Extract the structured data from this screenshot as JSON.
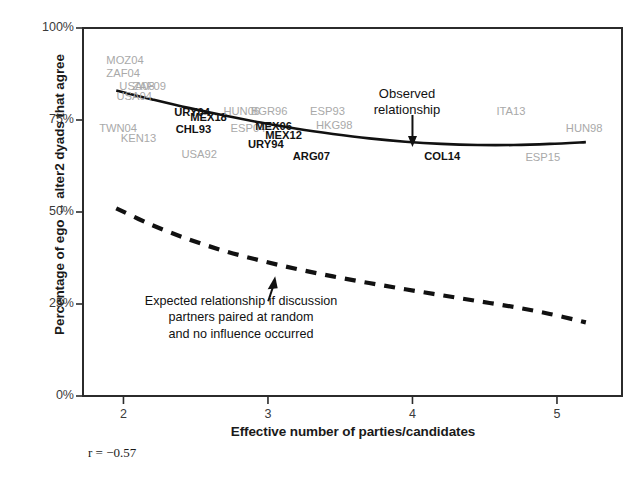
{
  "chart_data": {
    "type": "line",
    "title": "",
    "xlabel": "Effective number of parties/candidates",
    "ylabel": "Percentage of ego ↔ alter2 dyads that agree",
    "xlim": [
      1.72,
      5.45
    ],
    "ylim": [
      0,
      100
    ],
    "xticks": [
      "2",
      "3",
      "4",
      "5"
    ],
    "xtick_values": [
      2,
      3,
      4,
      5
    ],
    "yticks": [
      "0%",
      "25%",
      "50%",
      "75%",
      "100%"
    ],
    "ytick_values": [
      0,
      25,
      50,
      75,
      100
    ],
    "grid": false,
    "legend": "none",
    "correlation_label": "r = −0.57",
    "correlation_value": -0.57,
    "series": [
      {
        "name": "Observed relationship",
        "style": "solid",
        "color": "#111111",
        "x": [
          1.95,
          2.2,
          2.45,
          2.7,
          2.95,
          3.2,
          3.45,
          3.7,
          3.95,
          4.2,
          4.45,
          4.7,
          4.95,
          5.2
        ],
        "values": [
          83.0,
          80.6,
          78.3,
          76.2,
          74.3,
          72.6,
          71.2,
          70.0,
          69.1,
          68.5,
          68.2,
          68.2,
          68.5,
          69.0
        ]
      },
      {
        "name": "Expected relationship if discussion partners paired at random and no influence occurred",
        "style": "dashed",
        "color": "#111111",
        "x": [
          1.95,
          2.2,
          2.45,
          2.7,
          2.95,
          3.2,
          3.45,
          3.7,
          3.95,
          4.2,
          4.45,
          4.7,
          4.95,
          5.2
        ],
        "values": [
          51.0,
          46.4,
          42.6,
          39.4,
          36.8,
          34.5,
          32.5,
          30.7,
          29.0,
          27.4,
          25.8,
          24.2,
          22.3,
          20.0
        ]
      }
    ],
    "annotations": [
      {
        "name": "observed-relationship-annotation",
        "lines": [
          "Observed",
          "relationship"
        ],
        "text": "Observed relationship",
        "arrow": "down",
        "x": 4.0,
        "y": 71.0
      },
      {
        "name": "expected-relationship-annotation",
        "lines": [
          "Expected relationship if discussion",
          "partners paired at random",
          "and no influence occurred"
        ],
        "text": "Expected relationship if discussion partners paired at random and no influence occurred",
        "arrow": "up",
        "x": 3.05,
        "y": 32.0
      }
    ],
    "point_labels": [
      {
        "label": "MOZ04",
        "x": 2.02,
        "y": 91.0,
        "emphasis": "dim"
      },
      {
        "label": "ZAF04",
        "x": 2.02,
        "y": 87.4,
        "emphasis": "dim"
      },
      {
        "label": "USA08",
        "x": 2.11,
        "y": 83.9,
        "emphasis": "dim"
      },
      {
        "label": "ZAF09",
        "x": 2.2,
        "y": 83.9,
        "emphasis": "dim"
      },
      {
        "label": "USA04",
        "x": 2.09,
        "y": 81.2,
        "emphasis": "dim"
      },
      {
        "label": "TWN04",
        "x": 1.97,
        "y": 72.5,
        "emphasis": "dim"
      },
      {
        "label": "KEN13",
        "x": 2.12,
        "y": 69.8,
        "emphasis": "dim"
      },
      {
        "label": "URY04",
        "x": 2.49,
        "y": 77.0,
        "emphasis": "hi"
      },
      {
        "label": "MEX18",
        "x": 2.6,
        "y": 75.6,
        "emphasis": "hi"
      },
      {
        "label": "CHL93",
        "x": 2.5,
        "y": 72.4,
        "emphasis": "hi"
      },
      {
        "label": "USA92",
        "x": 2.54,
        "y": 65.4,
        "emphasis": "dim"
      },
      {
        "label": "HUN06",
        "x": 2.83,
        "y": 77.1,
        "emphasis": "dim"
      },
      {
        "label": "BGR96",
        "x": 3.02,
        "y": 77.1,
        "emphasis": "dim"
      },
      {
        "label": "ESP04",
        "x": 2.88,
        "y": 72.6,
        "emphasis": "dim"
      },
      {
        "label": "MEX06",
        "x": 3.05,
        "y": 73.2,
        "emphasis": "hi"
      },
      {
        "label": "MEX12",
        "x": 3.12,
        "y": 70.7,
        "emphasis": "hi"
      },
      {
        "label": "URY94",
        "x": 3.0,
        "y": 68.3,
        "emphasis": "hi"
      },
      {
        "label": "ARG07",
        "x": 3.31,
        "y": 64.9,
        "emphasis": "hi"
      },
      {
        "label": "ESP93",
        "x": 3.43,
        "y": 77.3,
        "emphasis": "dim"
      },
      {
        "label": "HKG98",
        "x": 3.47,
        "y": 73.3,
        "emphasis": "dim"
      },
      {
        "label": "COL14",
        "x": 4.22,
        "y": 64.9,
        "emphasis": "hi"
      },
      {
        "label": "ITA13",
        "x": 4.72,
        "y": 77.3,
        "emphasis": "dim"
      },
      {
        "label": "ESP15",
        "x": 4.92,
        "y": 64.7,
        "emphasis": "dim"
      },
      {
        "label": "HUN98",
        "x": 5.2,
        "y": 72.6,
        "emphasis": "dim"
      }
    ]
  }
}
